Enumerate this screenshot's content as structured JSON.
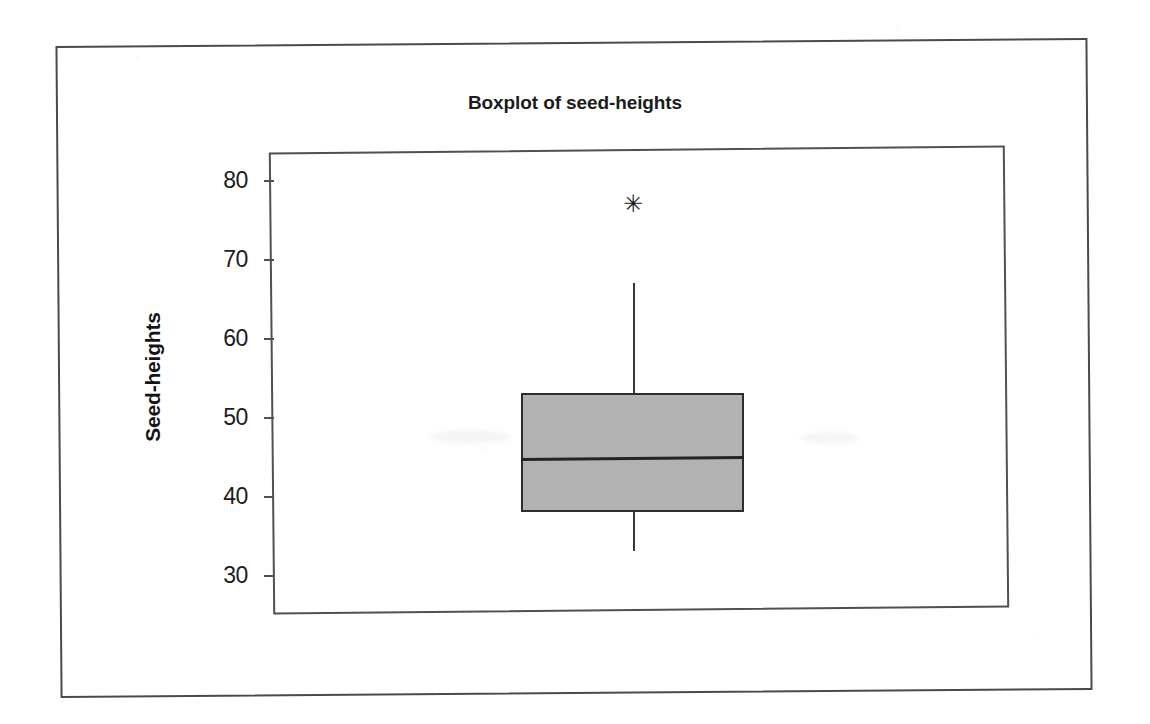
{
  "chart_data": {
    "type": "boxplot",
    "title": "Boxplot of seed-heights",
    "xlabel": "",
    "ylabel": "Seed-heights",
    "ylim": [
      26,
      83
    ],
    "yticks": [
      80,
      70,
      60,
      50,
      40,
      30
    ],
    "ytick_labels": [
      "80",
      "70",
      "60",
      "50",
      "40",
      "30"
    ],
    "grid": false,
    "legend": false,
    "series": [
      {
        "name": "seed-heights",
        "q1": 38,
        "median": 45,
        "q3": 53,
        "whisker_low": 33,
        "whisker_high": 67,
        "outliers": [
          77
        ],
        "outlier_marker": "asterisk"
      }
    ],
    "box_fill_color": "#b2b2b2",
    "box_edge_color": "#2d2d2d",
    "median_color": "#242424",
    "whisker_color": "#3a3a3a",
    "outlier_color": "#1a1a1a"
  },
  "figure": {
    "title": "Boxplot of seed-heights",
    "y_axis_title": "Seed-heights",
    "y_tick_labels": [
      "80",
      "70",
      "60",
      "50",
      "40",
      "30"
    ],
    "outlier_glyph": "✳"
  }
}
